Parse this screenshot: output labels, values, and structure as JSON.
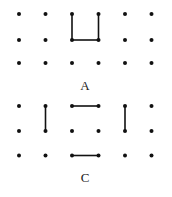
{
  "colors": {
    "ink": "#111111",
    "background": "#ffffff"
  },
  "grid": {
    "columns_x": [
      19,
      45.5,
      72,
      98.5,
      125,
      151.5
    ],
    "dot_radius": 2,
    "line_width": 1.6
  },
  "figures": [
    {
      "label": "A",
      "label_pos": [
        85,
        85
      ],
      "rows_y": [
        14,
        40,
        63
      ],
      "segments": [
        {
          "from": [
            2,
            0
          ],
          "to": [
            2,
            1
          ]
        },
        {
          "from": [
            2,
            1
          ],
          "to": [
            3,
            1
          ]
        },
        {
          "from": [
            3,
            1
          ],
          "to": [
            3,
            0
          ]
        }
      ]
    },
    {
      "label": "C",
      "label_pos": [
        85,
        177
      ],
      "rows_y": [
        106,
        131,
        155.5
      ],
      "segments": [
        {
          "from": [
            1,
            0
          ],
          "to": [
            1,
            1
          ]
        },
        {
          "from": [
            2,
            0
          ],
          "to": [
            3,
            0
          ]
        },
        {
          "from": [
            4,
            0
          ],
          "to": [
            4,
            1
          ]
        },
        {
          "from": [
            2,
            2
          ],
          "to": [
            3,
            2
          ]
        }
      ]
    }
  ]
}
